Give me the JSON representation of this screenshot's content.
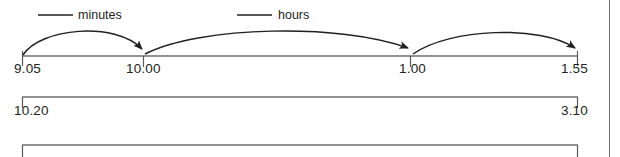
{
  "figure": {
    "kind": "number-line-time-diagram",
    "background_color": "#ffffff",
    "line_color": "#6d6e71",
    "arc_color": "#231f20",
    "text_color": "#231f20",
    "right_border": {
      "x": 609,
      "color": "#6d6e71"
    }
  },
  "timelines": [
    {
      "id": "timeline-1",
      "baseline_y": 56,
      "x_start": 22,
      "x_end": 578,
      "ticks": [
        {
          "x": 22,
          "label": "9.05",
          "align": "left"
        },
        {
          "x": 143,
          "label": "10.00",
          "align": "left"
        },
        {
          "x": 410,
          "label": "1.00",
          "align": "left"
        },
        {
          "x": 578,
          "label": "1.55",
          "align": "right"
        }
      ],
      "arcs": [
        {
          "from": 22,
          "to": 143,
          "apex_y": 27,
          "caption": "minutes",
          "caption_x": 78,
          "caption_y": 8,
          "leader": {
            "x1": 38,
            "x2": 73,
            "y": 15
          }
        },
        {
          "from": 143,
          "to": 410,
          "apex_y": 28,
          "caption": "hours",
          "caption_x": 278,
          "caption_y": 8,
          "leader": {
            "x1": 237,
            "x2": 272,
            "y": 15
          }
        },
        {
          "from": 410,
          "to": 578,
          "apex_y": 30,
          "caption": "",
          "caption_x": 0,
          "caption_y": 0,
          "leader": null
        }
      ]
    },
    {
      "id": "timeline-2",
      "baseline_y": 97,
      "x_start": 22,
      "x_end": 578,
      "ticks": [
        {
          "x": 22,
          "label": "10.20",
          "align": "left"
        },
        {
          "x": 578,
          "label": "3.10",
          "align": "right"
        }
      ],
      "arcs": []
    },
    {
      "id": "timeline-3",
      "baseline_y": 145,
      "x_start": 22,
      "x_end": 578,
      "ticks": [
        {
          "x": 22,
          "label": "",
          "align": "left"
        },
        {
          "x": 578,
          "label": "",
          "align": "right"
        }
      ],
      "arcs": []
    }
  ],
  "labels": {
    "t1_start": "9.05",
    "t1_mid1": "10.00",
    "t1_mid2": "1.00",
    "t1_end": "1.55",
    "t2_start": "10.20",
    "t2_end": "3.10",
    "caption_minutes": "minutes",
    "caption_hours": "hours"
  }
}
